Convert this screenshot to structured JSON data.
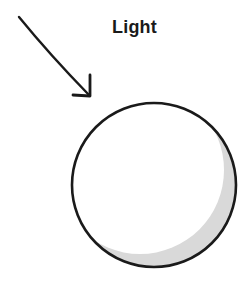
{
  "diagram": {
    "label": "Light",
    "colors": {
      "stroke": "#1a1a1a",
      "shadow": "#d9d9d9",
      "sphere_fill": "#ffffff",
      "background": "#ffffff"
    },
    "elements": [
      {
        "type": "arrow",
        "name": "light-direction-arrow",
        "from": [
          19,
          17
        ],
        "to": [
          90,
          96
        ]
      },
      {
        "type": "sphere",
        "name": "illuminated-sphere",
        "center": [
          154,
          185
        ],
        "radius": 83,
        "shadow_side": "lower-right"
      }
    ]
  }
}
